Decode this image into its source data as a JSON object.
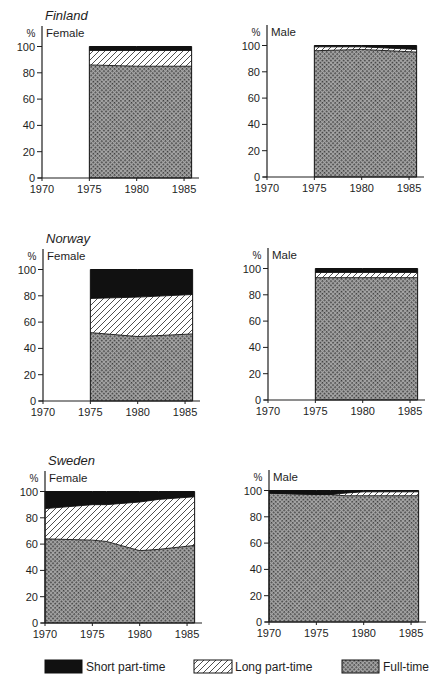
{
  "figure": {
    "legend": {
      "short_part_time": "Short part-time",
      "long_part_time": "Long part-time",
      "full_time": "Full-time"
    },
    "colors": {
      "short_part_time": "#111111",
      "long_part_time_bg": "#ffffff",
      "long_part_time_hatch": "#222222",
      "full_time_light": "#a6a6a6",
      "full_time_dark": "#3a3a3a"
    }
  },
  "chart_data": [
    {
      "type": "area",
      "stacked": true,
      "title": "Finland",
      "subtitle": "Female",
      "ylabel": "%",
      "xlabel": "",
      "ylim": [
        0,
        100
      ],
      "xlim": [
        1970,
        1986
      ],
      "xticks": [
        1970,
        1975,
        1980,
        1985
      ],
      "yticks": [
        0,
        20,
        40,
        60,
        80,
        100
      ],
      "grid": false,
      "x": [
        1975,
        1980,
        1985.8
      ],
      "series": [
        {
          "name": "Full-time",
          "key": "full_time",
          "values": [
            86,
            85,
            85
          ]
        },
        {
          "name": "Long part-time",
          "key": "long_part_time",
          "values": [
            11,
            12,
            12
          ]
        },
        {
          "name": "Short part-time",
          "key": "short_part_time",
          "values": [
            3,
            3,
            3
          ]
        }
      ]
    },
    {
      "type": "area",
      "stacked": true,
      "title": "",
      "subtitle": "Male",
      "ylabel": "%",
      "xlabel": "",
      "ylim": [
        0,
        100
      ],
      "xlim": [
        1970,
        1986
      ],
      "xticks": [
        1970,
        1975,
        1980,
        1985
      ],
      "yticks": [
        0,
        20,
        40,
        60,
        80,
        100
      ],
      "grid": false,
      "x": [
        1975,
        1980,
        1985.8
      ],
      "series": [
        {
          "name": "Full-time",
          "key": "full_time",
          "values": [
            96,
            97,
            95
          ]
        },
        {
          "name": "Long part-time",
          "key": "long_part_time",
          "values": [
            3,
            2,
            2
          ]
        },
        {
          "name": "Short part-time",
          "key": "short_part_time",
          "values": [
            1,
            1,
            3
          ]
        }
      ]
    },
    {
      "type": "area",
      "stacked": true,
      "title": "Norway",
      "subtitle": "Female",
      "ylabel": "%",
      "xlabel": "",
      "ylim": [
        0,
        100
      ],
      "xlim": [
        1970,
        1986
      ],
      "xticks": [
        1970,
        1975,
        1980,
        1985
      ],
      "yticks": [
        0,
        20,
        40,
        60,
        80,
        100
      ],
      "grid": false,
      "x": [
        1975,
        1980,
        1985.8
      ],
      "series": [
        {
          "name": "Full-time",
          "key": "full_time",
          "values": [
            52,
            49,
            51
          ]
        },
        {
          "name": "Long part-time",
          "key": "long_part_time",
          "values": [
            26,
            30,
            30
          ]
        },
        {
          "name": "Short part-time",
          "key": "short_part_time",
          "values": [
            22,
            21,
            19
          ]
        }
      ]
    },
    {
      "type": "area",
      "stacked": true,
      "title": "",
      "subtitle": "Male",
      "ylabel": "%",
      "xlabel": "",
      "ylim": [
        0,
        100
      ],
      "xlim": [
        1970,
        1986
      ],
      "xticks": [
        1970,
        1975,
        1980,
        1985
      ],
      "yticks": [
        0,
        20,
        40,
        60,
        80,
        100
      ],
      "grid": false,
      "x": [
        1975,
        1980,
        1985.8
      ],
      "series": [
        {
          "name": "Full-time",
          "key": "full_time",
          "values": [
            93,
            93,
            93
          ]
        },
        {
          "name": "Long part-time",
          "key": "long_part_time",
          "values": [
            4,
            4,
            4
          ]
        },
        {
          "name": "Short part-time",
          "key": "short_part_time",
          "values": [
            3,
            3,
            3
          ]
        }
      ]
    },
    {
      "type": "area",
      "stacked": true,
      "title": "Sweden",
      "subtitle": "Female",
      "ylabel": "%",
      "xlabel": "",
      "ylim": [
        0,
        100
      ],
      "xlim": [
        1970,
        1986
      ],
      "xticks": [
        1970,
        1975,
        1980,
        1985
      ],
      "yticks": [
        0,
        20,
        40,
        60,
        80,
        100
      ],
      "grid": false,
      "x": [
        1970,
        1975,
        1976.5,
        1980,
        1982,
        1985.8
      ],
      "series": [
        {
          "name": "Full-time",
          "key": "full_time",
          "values": [
            64,
            63,
            62,
            55,
            56,
            59
          ]
        },
        {
          "name": "Long part-time",
          "key": "long_part_time",
          "values": [
            23,
            27,
            28,
            37,
            38,
            37
          ]
        },
        {
          "name": "Short part-time",
          "key": "short_part_time",
          "values": [
            13,
            10,
            10,
            8,
            6,
            4
          ]
        }
      ]
    },
    {
      "type": "area",
      "stacked": true,
      "title": "",
      "subtitle": "Male",
      "ylabel": "%",
      "xlabel": "",
      "ylim": [
        0,
        100
      ],
      "xlim": [
        1970,
        1986
      ],
      "xticks": [
        1970,
        1975,
        1980,
        1985
      ],
      "yticks": [
        0,
        20,
        40,
        60,
        80,
        100
      ],
      "grid": false,
      "x": [
        1970,
        1975,
        1976.5,
        1978,
        1980,
        1985.8
      ],
      "series": [
        {
          "name": "Full-time",
          "key": "full_time",
          "values": [
            98,
            97,
            97,
            96,
            96,
            96
          ]
        },
        {
          "name": "Long part-time",
          "key": "long_part_time",
          "values": [
            0,
            0,
            0,
            2,
            3,
            3
          ]
        },
        {
          "name": "Short part-time",
          "key": "short_part_time",
          "values": [
            2,
            3,
            3,
            2,
            1,
            1
          ]
        }
      ]
    }
  ]
}
